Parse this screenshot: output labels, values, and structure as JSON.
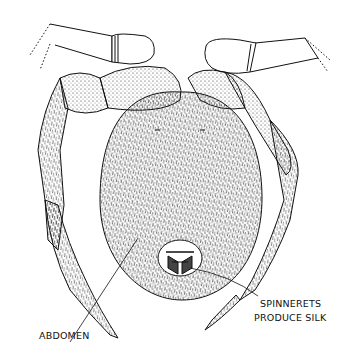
{
  "figure": {
    "colors": {
      "ink": "#111111",
      "background": "#ffffff"
    },
    "labels": [
      {
        "id": "abdomen",
        "text": "ABDOMEN"
      },
      {
        "id": "spinnerets",
        "line1": "SPINNERETS",
        "line2": "PRODUCE SILK"
      }
    ]
  }
}
